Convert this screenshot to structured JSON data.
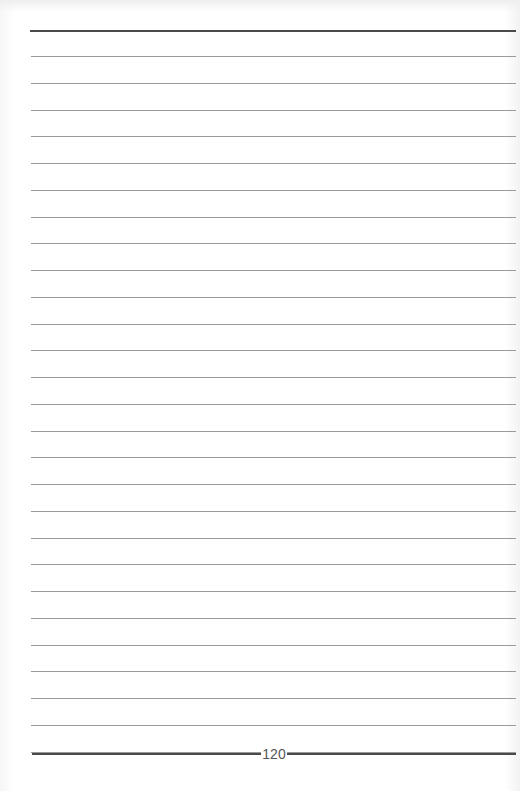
{
  "document": {
    "type": "lined-notebook-page",
    "page_number": "120",
    "ruled_lines": {
      "top_thick_y": 30,
      "first_thin_y": 56,
      "spacing": 26.75,
      "count": 27,
      "left_x": 30,
      "right_x": 516
    },
    "colors": {
      "paper": "#ffffff",
      "thin_rule": "#9a9a9a",
      "thick_rule": "#4a4a4a",
      "page_number": "#555555"
    }
  }
}
